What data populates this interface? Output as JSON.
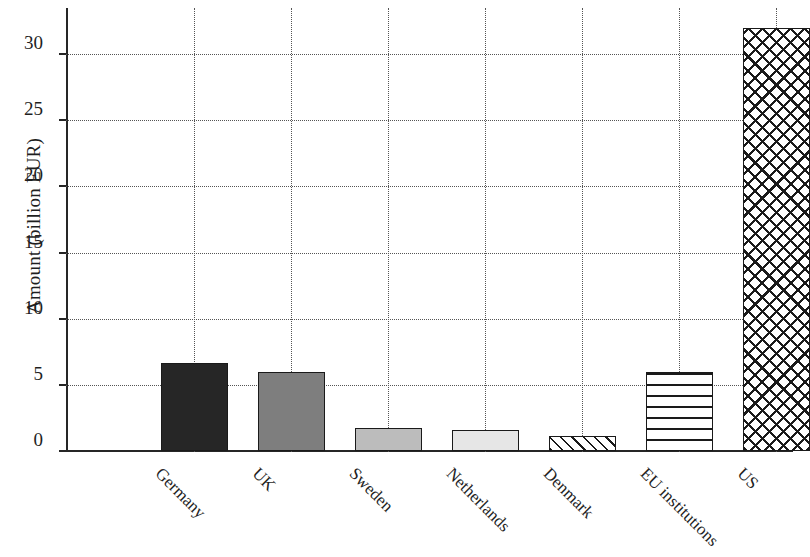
{
  "chart_data": {
    "type": "bar",
    "title": "",
    "xlabel": "",
    "ylabel": "Amount (billion EUR)",
    "ylim": [
      0,
      33.5
    ],
    "yticks": [
      0,
      5,
      10,
      15,
      20,
      25,
      30
    ],
    "ytick_labels": [
      "0",
      "5",
      "10",
      "15",
      "20",
      "25",
      "30"
    ],
    "grid": "dotted horizontal and vertical gridlines",
    "legend": "none",
    "categories": [
      "Germany",
      "UK",
      "Sweden",
      "Netherlands",
      "Denmark",
      "EU institutions",
      "US"
    ],
    "values": [
      6.65,
      6.0,
      1.75,
      1.6,
      1.1,
      6.0,
      32.0
    ],
    "bars": [
      {
        "label": "Germany",
        "value": 6.65,
        "fill": "solid dark gray",
        "color": "#262626"
      },
      {
        "label": "UK",
        "value": 6.0,
        "fill": "solid medium gray",
        "color": "#7e7e7e"
      },
      {
        "label": "Sweden",
        "value": 1.75,
        "fill": "solid light gray",
        "color": "#bcbcbc"
      },
      {
        "label": "Netherlands",
        "value": 1.6,
        "fill": "solid pale gray",
        "color": "#e6e6e6"
      },
      {
        "label": "Denmark",
        "value": 1.1,
        "fill": "diagonal hatch",
        "color": "#ffffff"
      },
      {
        "label": "EU institutions",
        "value": 6.0,
        "fill": "horizontal lines",
        "color": "#ffffff"
      },
      {
        "label": "US",
        "value": 32.0,
        "fill": "cross hatch",
        "color": "#ffffff"
      }
    ]
  }
}
